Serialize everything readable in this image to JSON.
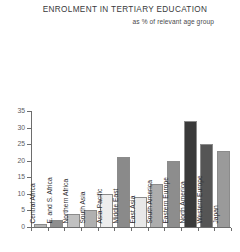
{
  "header": {
    "title": "ENROLMENT IN TERTIARY EDUCATION",
    "subtitle": "as % of relevant age group"
  },
  "chart_data": {
    "type": "bar",
    "title": "ENROLMENT IN TERTIARY EDUCATION",
    "subtitle": "as % of relevant age group",
    "xlabel": "",
    "ylabel": "",
    "ylim": [
      0,
      35
    ],
    "yticks": [
      0,
      5,
      10,
      15,
      20,
      25,
      30,
      35
    ],
    "ytick_labels": [
      "0",
      "5",
      "10",
      "15",
      "20",
      "25",
      "30",
      "35"
    ],
    "grid": false,
    "legend": false,
    "categories": [
      "Central Africa",
      "E. and S. Africa",
      "Northern Africa",
      "South Asia",
      "Asia-Pacific",
      "Middle East",
      "East Asia",
      "South America",
      "Eastern Europe",
      "North America",
      "Western Europe",
      "Japan"
    ],
    "values": [
      1,
      2,
      4,
      5,
      10,
      21,
      9,
      13,
      20,
      32,
      25,
      23
    ],
    "bar_colors": [
      "#b4b4b4",
      "#8e8e8e",
      "#c0c0c0",
      "#b0b0b0",
      "#ededed",
      "#8a8a8a",
      "#e8e8e8",
      "#adadad",
      "#8d8d8d",
      "#3a3a3a",
      "#555555",
      "#9a9a9a"
    ]
  },
  "axis": {
    "line_color": "#6d6d6d",
    "label_color": "#5d5d5f"
  }
}
